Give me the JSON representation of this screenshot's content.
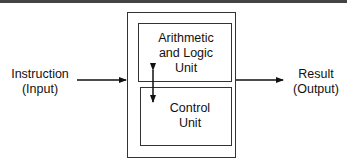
{
  "diagram": {
    "input": {
      "line1": "Instruction",
      "line2": "(Input)"
    },
    "output": {
      "line1": "Result",
      "line2": "(Output)"
    },
    "alu": {
      "line1": "Arithmetic",
      "line2": "and Logic",
      "line3": "Unit"
    },
    "control": {
      "line1": "Control",
      "line2": "Unit"
    }
  }
}
